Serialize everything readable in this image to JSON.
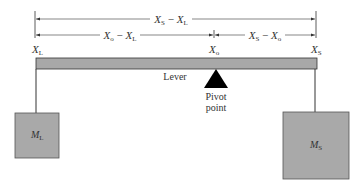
{
  "diagram": {
    "type": "lever",
    "dimensions": {
      "total": {
        "main": "X",
        "sub1": "S",
        "mid": " − ",
        "main2": "X",
        "sub2": "L"
      },
      "left": {
        "main": "X",
        "sub1": "o",
        "mid": " − ",
        "main2": "X",
        "sub2": "L"
      },
      "right": {
        "main": "X",
        "sub1": "S",
        "mid": " − ",
        "main2": "X",
        "sub2": "o"
      }
    },
    "points": {
      "xl": {
        "main": "X",
        "sub": "L"
      },
      "xo": {
        "main": "X",
        "sub": "o"
      },
      "xs": {
        "main": "X",
        "sub": "S"
      }
    },
    "lever_label": "Lever",
    "pivot_label_line1": "Pivot",
    "pivot_label_line2": "point",
    "mass_left": {
      "main": "M",
      "sub": "L"
    },
    "mass_right": {
      "main": "M",
      "sub": "S"
    },
    "colors": {
      "lever": "#a8a8a8",
      "mass": "#a9a9a9",
      "pivot": "#000000",
      "line": "#333333"
    }
  }
}
